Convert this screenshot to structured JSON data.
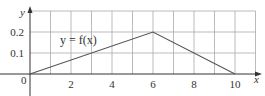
{
  "chart_data": {
    "type": "line",
    "title": "",
    "xlabel": "x",
    "ylabel": "y",
    "x": [
      0,
      6,
      10
    ],
    "series": [
      {
        "name": "y = f(x)",
        "values": [
          0,
          0.2,
          0
        ]
      }
    ],
    "xlim": [
      0,
      11
    ],
    "ylim": [
      0,
      0.3
    ],
    "x_ticks": [
      0,
      2,
      4,
      6,
      8,
      10
    ],
    "x_tick_labels": [
      "2",
      "4",
      "6",
      "8",
      "10"
    ],
    "y_ticks": [
      0.1,
      0.2
    ],
    "y_tick_labels": [
      "0.1",
      "0.2"
    ],
    "origin_label": "0",
    "grid": true,
    "grid_x_step": 1,
    "grid_y_step": 0.1,
    "annotations": [
      {
        "text": "y = f(x)",
        "x": 2.5,
        "y": 0.15
      }
    ],
    "colors": {
      "line": "#555555",
      "grid": "#aaaaaa",
      "axis": "#333333"
    }
  }
}
